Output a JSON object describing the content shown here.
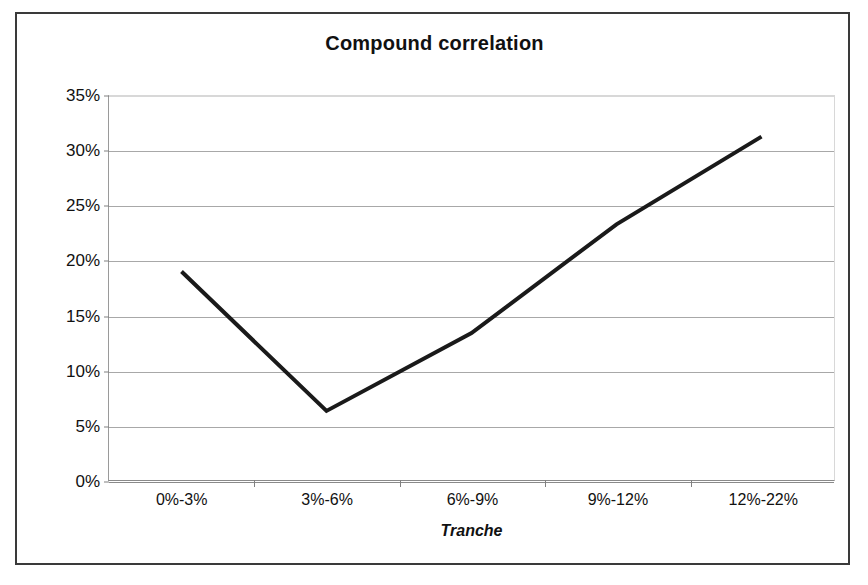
{
  "chart_data": {
    "type": "line",
    "title": "Compound correlation",
    "xlabel": "Tranche",
    "ylabel": "",
    "categories": [
      "0%-3%",
      "3%-6%",
      "6%-9%",
      "9%-12%",
      "12%-22%"
    ],
    "values": [
      19.0,
      6.3,
      13.4,
      23.3,
      31.3
    ],
    "series": [
      {
        "name": "Compound correlation",
        "values": [
          19.0,
          6.3,
          13.4,
          23.3,
          31.3
        ]
      }
    ],
    "ylim": [
      0,
      35
    ],
    "ytick_labels": [
      "0%",
      "5%",
      "10%",
      "15%",
      "20%",
      "25%",
      "30%",
      "35%"
    ],
    "ytick_values": [
      0,
      5,
      10,
      15,
      20,
      25,
      30,
      35
    ],
    "grid": true,
    "legend": false,
    "value_format": "percent",
    "line_color": "#1a1a1a",
    "line_width": 4,
    "plot_background": "#ffffff",
    "gridline_color": "#a8a8a8"
  }
}
